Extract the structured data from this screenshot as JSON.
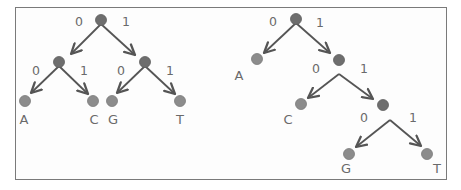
{
  "colors": {
    "frame": "#7a7a7a",
    "edge": "#555555",
    "internal_node": "#6e6e6e",
    "leaf_node": "#8c8c8c",
    "text": "#6a6a6a"
  },
  "trees": [
    {
      "name": "balanced-tree",
      "nodes": [
        {
          "id": "L0",
          "type": "internal",
          "x": 101,
          "y": 20
        },
        {
          "id": "L1",
          "type": "internal",
          "x": 59,
          "y": 62
        },
        {
          "id": "L2",
          "type": "internal",
          "x": 145,
          "y": 62
        },
        {
          "id": "LA",
          "type": "leaf",
          "x": 25,
          "y": 101,
          "label": "A",
          "lx": 24,
          "ly": 119
        },
        {
          "id": "LC",
          "type": "leaf",
          "x": 93,
          "y": 101,
          "label": "C",
          "lx": 94,
          "ly": 119
        },
        {
          "id": "LG",
          "type": "leaf",
          "x": 112,
          "y": 101,
          "label": "G",
          "lx": 113,
          "ly": 119
        },
        {
          "id": "LT",
          "type": "leaf",
          "x": 180,
          "y": 101,
          "label": "T",
          "lx": 180,
          "ly": 119
        }
      ],
      "edges": [
        {
          "from": [
            101,
            24
          ],
          "to": [
            71,
            54
          ],
          "bit": "0",
          "bx": 79,
          "by": 22
        },
        {
          "from": [
            101,
            24
          ],
          "to": [
            135,
            55
          ],
          "bit": "1",
          "bx": 126,
          "by": 22
        },
        {
          "from": [
            59,
            66
          ],
          "to": [
            31,
            93
          ],
          "bit": "0",
          "bx": 36,
          "by": 71
        },
        {
          "from": [
            59,
            66
          ],
          "to": [
            88,
            94
          ],
          "bit": "1",
          "bx": 84,
          "by": 71
        },
        {
          "from": [
            145,
            66
          ],
          "to": [
            117,
            93
          ],
          "bit": "0",
          "bx": 121,
          "by": 71
        },
        {
          "from": [
            145,
            66
          ],
          "to": [
            175,
            94
          ],
          "bit": "1",
          "bx": 170,
          "by": 71
        }
      ]
    },
    {
      "name": "skewed-tree",
      "nodes": [
        {
          "id": "R0",
          "type": "internal",
          "x": 296,
          "y": 19
        },
        {
          "id": "R1",
          "type": "internal",
          "x": 339,
          "y": 60
        },
        {
          "id": "R2",
          "type": "internal",
          "x": 383,
          "y": 105
        },
        {
          "id": "RA",
          "type": "leaf",
          "x": 257,
          "y": 59,
          "label": "A",
          "lx": 239,
          "ly": 75
        },
        {
          "id": "RC",
          "type": "leaf",
          "x": 301,
          "y": 104,
          "label": "C",
          "lx": 288,
          "ly": 119
        },
        {
          "id": "RG",
          "type": "leaf",
          "x": 349,
          "y": 154,
          "label": "G",
          "lx": 346,
          "ly": 168
        },
        {
          "id": "RT",
          "type": "leaf",
          "x": 427,
          "y": 154,
          "label": "T",
          "lx": 437,
          "ly": 168
        }
      ],
      "edges": [
        {
          "from": [
            296,
            23
          ],
          "to": [
            264,
            53
          ],
          "bit": "0",
          "bx": 273,
          "by": 22
        },
        {
          "from": [
            296,
            23
          ],
          "to": [
            330,
            53
          ],
          "bit": "1",
          "bx": 320,
          "by": 23
        },
        {
          "from": [
            339,
            74
          ],
          "to": [
            308,
            98
          ],
          "bit": "0",
          "bx": 316,
          "by": 69
        },
        {
          "from": [
            339,
            74
          ],
          "to": [
            373,
            99
          ],
          "bit": "1",
          "bx": 364,
          "by": 69
        },
        {
          "from": [
            390,
            120
          ],
          "to": [
            356,
            147
          ],
          "bit": "0",
          "bx": 364,
          "by": 118
        },
        {
          "from": [
            390,
            120
          ],
          "to": [
            421,
            146
          ],
          "bit": "1",
          "bx": 413,
          "by": 118
        }
      ]
    }
  ]
}
